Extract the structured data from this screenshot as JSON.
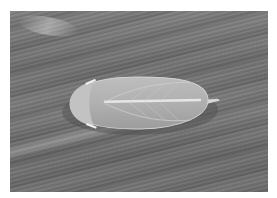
{
  "image": {
    "description": "Grayscale photograph of a pale leafhopper-like insect resting on a striated leaf surface",
    "subject": "insect",
    "colors": {
      "background": "#ffffff",
      "surface": "#747474",
      "insect_body": "#b4b4b4",
      "insect_highlight": "#e6e6e6"
    }
  }
}
